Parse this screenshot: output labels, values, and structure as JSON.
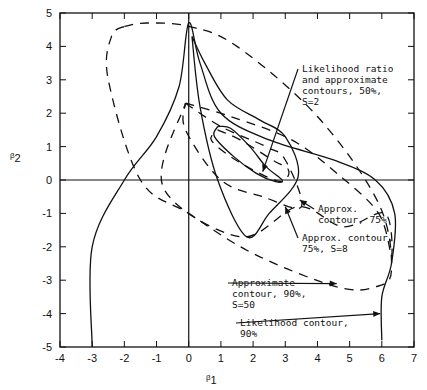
{
  "chart_data": {
    "type": "line",
    "title": "",
    "xlabel": "β1",
    "ylabel": "β2",
    "xlim": [
      -4,
      7
    ],
    "ylim": [
      -5,
      5
    ],
    "xticks": [
      -4,
      -3,
      -2,
      -1,
      0,
      1,
      2,
      3,
      4,
      5,
      6,
      7
    ],
    "yticks": [
      -5,
      -4,
      -3,
      -2,
      -1,
      0,
      1,
      2,
      3,
      4,
      5
    ],
    "grid": false,
    "reference_lines": {
      "x": 0,
      "y": 0
    },
    "series": [
      {
        "name": "Likelihood ratio contour, 50%",
        "style": "solid",
        "points": [
          [
            0.9,
            1.6
          ],
          [
            1.3,
            1.55
          ],
          [
            1.9,
            1.0
          ],
          [
            2.4,
            0.4
          ],
          [
            2.9,
            0.0
          ],
          [
            2.7,
            -0.05
          ],
          [
            2.1,
            0.2
          ],
          [
            1.4,
            0.7
          ],
          [
            0.8,
            1.3
          ],
          [
            0.9,
            1.6
          ]
        ]
      },
      {
        "name": "Approximate contour, 50%, S=2",
        "style": "dashed",
        "points": [
          [
            0.9,
            1.5
          ],
          [
            1.6,
            1.2
          ],
          [
            2.6,
            0.6
          ],
          [
            3.1,
            0.3
          ],
          [
            2.9,
            -0.05
          ],
          [
            2.2,
            0.2
          ],
          [
            1.3,
            0.7
          ],
          [
            0.7,
            1.2
          ],
          [
            0.9,
            1.5
          ]
        ]
      },
      {
        "name": "Likelihood contour, 75%",
        "style": "solid",
        "points": [
          [
            0.1,
            4.3
          ],
          [
            0.35,
            2.2
          ],
          [
            0.9,
            0.0
          ],
          [
            1.8,
            -1.7
          ],
          [
            2.5,
            -1.0
          ],
          [
            3.4,
            0.1
          ],
          [
            3.0,
            1.3
          ],
          [
            2.2,
            1.8
          ],
          [
            1.2,
            2.4
          ],
          [
            0.5,
            3.5
          ],
          [
            0.1,
            4.3
          ]
        ]
      },
      {
        "name": "Approx. contour, 75%",
        "style": "dashed",
        "points": [
          [
            -0.1,
            2.3
          ],
          [
            1.0,
            1.6
          ],
          [
            2.4,
            1.0
          ],
          [
            3.0,
            0.6
          ],
          [
            3.5,
            -0.8
          ],
          [
            2.3,
            -0.5
          ],
          [
            1.0,
            0.0
          ],
          [
            -0.1,
            1.5
          ],
          [
            -0.1,
            2.3
          ]
        ]
      },
      {
        "name": "Approx. contour, 75%, S=8",
        "style": "dashed",
        "points": [
          [
            -0.1,
            2.3
          ],
          [
            1.3,
            1.9
          ],
          [
            3.2,
            1.2
          ],
          [
            4.6,
            0.2
          ],
          [
            5.9,
            -1.0
          ],
          [
            6.3,
            -2.3
          ],
          [
            6.1,
            -1.0
          ],
          [
            4.8,
            -1.4
          ],
          [
            3.4,
            -0.8
          ],
          [
            1.6,
            -1.7
          ],
          [
            -0.8,
            -0.2
          ],
          [
            -0.1,
            2.3
          ]
        ]
      },
      {
        "name": "Likelihood contour, 90%",
        "style": "solid",
        "points": [
          [
            -3.0,
            -5.0
          ],
          [
            -3.0,
            -2.0
          ],
          [
            -2.0,
            0.0
          ],
          [
            -1.0,
            1.3
          ],
          [
            -0.3,
            2.8
          ],
          [
            0.0,
            4.7
          ],
          [
            0.35,
            3.5
          ],
          [
            1.0,
            2.0
          ],
          [
            2.5,
            1.2
          ],
          [
            4.5,
            0.6
          ],
          [
            5.8,
            0.0
          ],
          [
            6.4,
            -1.0
          ],
          [
            6.3,
            -2.5
          ],
          [
            6.0,
            -3.5
          ],
          [
            6.0,
            -4.8
          ]
        ]
      },
      {
        "name": "Approximate contour, 90%, S=50",
        "style": "dashed",
        "points": [
          [
            -2.0,
            4.6
          ],
          [
            -1.3,
            4.7
          ],
          [
            0.0,
            4.6
          ],
          [
            1.5,
            4.0
          ],
          [
            4.0,
            1.9
          ],
          [
            5.9,
            -0.7
          ],
          [
            6.3,
            -2.7
          ],
          [
            5.8,
            -3.2
          ],
          [
            4.6,
            -3.2
          ],
          [
            2.0,
            -2.2
          ],
          [
            0.0,
            -1.0
          ],
          [
            -1.5,
            0.0
          ],
          [
            -2.5,
            3.0
          ],
          [
            -2.4,
            4.3
          ],
          [
            -2.0,
            4.6
          ]
        ]
      }
    ],
    "annotations": [
      {
        "lines": [
          "Likelihood ratio",
          "and approximate",
          "contours, 50%,",
          "S=2"
        ],
        "x": 302,
        "y": 72,
        "arrow_to": [
          2.3,
          0.25
        ]
      },
      {
        "lines": [
          "Approx.",
          "contour, 75%"
        ],
        "x": 318,
        "y": 212,
        "arrow_to": [
          3.45,
          -0.6
        ]
      },
      {
        "lines": [
          "Approx. contour,",
          "75%, S=8"
        ],
        "x": 302,
        "y": 241,
        "arrow_to": [
          3.0,
          -0.8
        ]
      },
      {
        "lines": [
          "Approximate",
          "contour, 90%,",
          "S=50"
        ],
        "x": 232,
        "y": 286,
        "arrow_to": [
          4.6,
          -3.1
        ]
      },
      {
        "lines": [
          "Likelihood contour,",
          "90%"
        ],
        "x": 240,
        "y": 326,
        "arrow_to": [
          5.95,
          -4.0
        ]
      }
    ]
  },
  "axes": {
    "x_title": "β",
    "x_sub": "1",
    "y_title": "β",
    "y_sub": "2"
  }
}
